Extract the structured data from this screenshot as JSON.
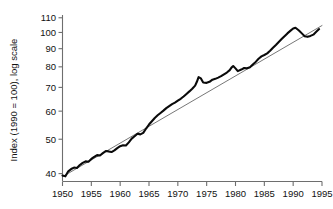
{
  "chart_data": {
    "type": "line",
    "title": "",
    "xlabel": "",
    "ylabel": "Index (1990 = 100), log scale",
    "yscale": "log",
    "xlim": [
      1950,
      1995
    ],
    "ylim": [
      38,
      112
    ],
    "grid": false,
    "legend": "none",
    "xticks": [
      1950,
      1955,
      1960,
      1965,
      1970,
      1975,
      1980,
      1985,
      1990,
      1995
    ],
    "xticklabels": [
      "1950",
      "1955",
      "1960",
      "1965",
      "1970",
      "1975",
      "1980",
      "1985",
      "1990",
      "1995"
    ],
    "yticks": [
      40,
      50,
      60,
      70,
      80,
      90,
      100,
      110
    ],
    "yticklabels": [
      "40",
      "50",
      "60",
      "70",
      "80",
      "90",
      "100",
      "110"
    ],
    "series": [
      {
        "name": "index",
        "style": "thick-black-line",
        "color": "#0a0a0a",
        "x": [
          1950,
          1950.5,
          1951,
          1951.5,
          1952,
          1952.5,
          1953,
          1953.5,
          1954,
          1954.5,
          1955,
          1955.5,
          1956,
          1956.5,
          1957,
          1957.5,
          1958,
          1958.5,
          1959,
          1959.5,
          1960,
          1960.5,
          1961,
          1961.5,
          1962,
          1962.5,
          1963,
          1963.5,
          1964,
          1964.5,
          1965,
          1965.5,
          1966,
          1966.5,
          1967,
          1967.5,
          1968,
          1968.5,
          1969,
          1969.5,
          1970,
          1970.5,
          1971,
          1971.5,
          1972,
          1972.5,
          1973,
          1973.3,
          1973.6,
          1974,
          1974.4,
          1975,
          1975.5,
          1976,
          1976.5,
          1977,
          1977.5,
          1978,
          1978.5,
          1979,
          1979.3,
          1979.6,
          1980,
          1980.4,
          1981,
          1981.5,
          1982,
          1982.5,
          1983,
          1983.5,
          1984,
          1984.5,
          1985,
          1985.5,
          1986,
          1986.5,
          1987,
          1987.5,
          1988,
          1988.5,
          1989,
          1989.5,
          1990,
          1990.4,
          1991,
          1991.5,
          1992,
          1992.5,
          1993,
          1993.5,
          1994,
          1994.5
        ],
        "y": [
          39.5,
          39.3,
          40.6,
          41.2,
          41.6,
          41.5,
          42.3,
          42.9,
          43.3,
          43.2,
          44.0,
          44.6,
          45.1,
          45.0,
          45.7,
          46.3,
          46.2,
          46.0,
          46.5,
          47.2,
          47.8,
          48.1,
          48.0,
          49.0,
          50.2,
          51.0,
          51.8,
          51.6,
          52.1,
          53.6,
          55.0,
          56.2,
          57.4,
          58.4,
          59.3,
          60.2,
          61.2,
          62.0,
          62.8,
          63.4,
          64.2,
          65.0,
          66.0,
          67.1,
          68.2,
          69.4,
          70.8,
          72.6,
          74.8,
          74.2,
          72.3,
          72.1,
          72.6,
          73.6,
          74.0,
          74.6,
          75.3,
          76.2,
          77.1,
          78.3,
          79.6,
          80.4,
          79.2,
          77.8,
          78.6,
          79.4,
          79.3,
          79.8,
          81.2,
          82.6,
          84.3,
          85.6,
          86.4,
          87.3,
          88.8,
          90.5,
          92.2,
          94.0,
          95.8,
          97.6,
          99.4,
          101.0,
          102.6,
          103.1,
          101.3,
          99.4,
          97.6,
          97.2,
          97.8,
          98.6,
          100.4,
          102.2
        ]
      },
      {
        "name": "trend",
        "style": "thin-grey-line",
        "color": "#4a4a4a",
        "x": [
          1950,
          1995
        ],
        "y": [
          39.2,
          104.6
        ]
      }
    ],
    "annotations": []
  }
}
